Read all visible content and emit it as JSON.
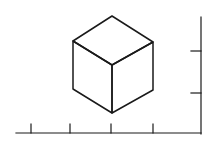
{
  "diagram": {
    "stroke_color": "#1a1a1a",
    "background": "#ffffff",
    "cube": {
      "vertices": {
        "top": [
          112,
          16
        ],
        "upper_left": [
          73,
          41
        ],
        "upper_right": [
          153,
          42
        ],
        "center": [
          112,
          65
        ],
        "lower_left": [
          73,
          89
        ],
        "lower_right": [
          153,
          90
        ],
        "bottom": [
          112,
          113
        ]
      }
    },
    "x_axis": {
      "y": 133,
      "x_start": 16,
      "x_end": 201,
      "ticks_x": [
        31,
        70,
        111,
        153
      ],
      "tick_top": 124
    },
    "y_axis": {
      "x": 201,
      "y_start": 17,
      "y_end": 134,
      "ticks_y": [
        51,
        93
      ],
      "tick_left": 191
    }
  }
}
